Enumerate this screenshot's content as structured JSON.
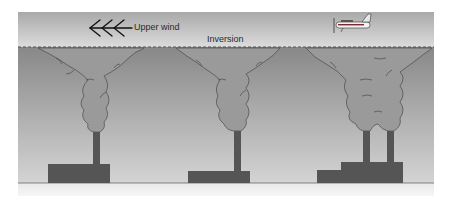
{
  "diagram": {
    "labels": {
      "upper_wind": "Upper wind",
      "inversion": "Inversion"
    },
    "icons": [
      "wind-arrow-icon",
      "airplane-icon"
    ],
    "elements": [
      {
        "name": "smokestack-1",
        "chimneys": 1,
        "plume": "fanning under inversion"
      },
      {
        "name": "smokestack-2",
        "chimneys": 1,
        "plume": "fanning under inversion"
      },
      {
        "name": "smokestack-3",
        "chimneys": 2,
        "plume": "merged plume fanning under inversion"
      }
    ],
    "colors": {
      "upper_layer": "#c9c9c9",
      "lower_air_top": "#8a8a8a",
      "lower_air_bottom": "#d2d2d2",
      "smoke": "#999999",
      "building": "#555555",
      "ground": "#e6e6e6"
    }
  }
}
